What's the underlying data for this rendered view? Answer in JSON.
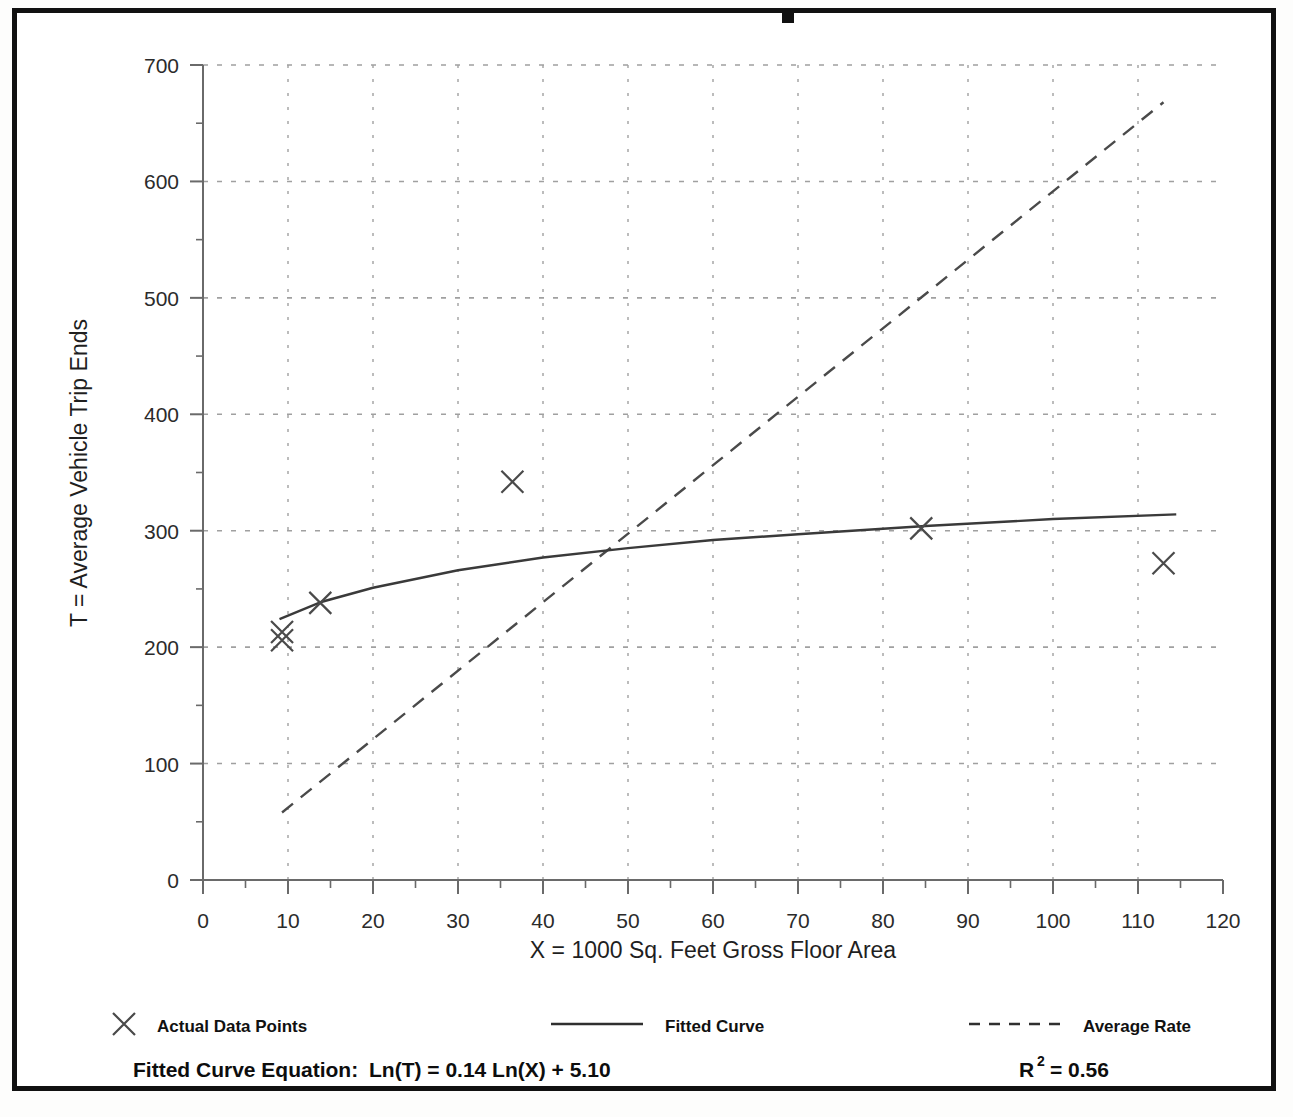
{
  "frame": {
    "top_marker": "black-tab-mark"
  },
  "chart_data": {
    "type": "scatter",
    "title": "",
    "xlabel": "X = 1000 Sq. Feet Gross Floor Area",
    "ylabel": "T = Average Vehicle Trip Ends",
    "xlim": [
      0,
      120
    ],
    "ylim": [
      0,
      700
    ],
    "xticks": [
      0,
      10,
      20,
      30,
      40,
      50,
      60,
      70,
      80,
      90,
      100,
      110,
      120
    ],
    "yticks": [
      0,
      100,
      200,
      300,
      400,
      500,
      600,
      700
    ],
    "xtick_labels": [
      "0",
      "10",
      "20",
      "30",
      "40",
      "50",
      "60",
      "70",
      "80",
      "90",
      "100",
      "110",
      "120"
    ],
    "ytick_labels": [
      "0",
      "100",
      "200",
      "300",
      "400",
      "500",
      "600",
      "700"
    ],
    "x_minor_step": 5,
    "y_minor_step": 50,
    "grid": true,
    "grid_style": "dotted",
    "legend_position": "below-plot",
    "series": [
      {
        "name": "Actual Data Points",
        "type": "scatter",
        "marker": "x",
        "points": [
          {
            "x": 9.3,
            "y": 213
          },
          {
            "x": 9.3,
            "y": 206
          },
          {
            "x": 13.8,
            "y": 238
          },
          {
            "x": 36.4,
            "y": 342
          },
          {
            "x": 84.5,
            "y": 302
          },
          {
            "x": 113.0,
            "y": 272
          }
        ]
      },
      {
        "name": "Fitted Curve",
        "type": "line",
        "style": "solid",
        "equation": "Ln(T) = 0.14 Ln(X) + 5.10",
        "a": 0.14,
        "b": 5.1,
        "x_range": [
          9.0,
          114.5
        ],
        "points": [
          {
            "x": 9.0,
            "y": 224
          },
          {
            "x": 14.0,
            "y": 239
          },
          {
            "x": 20.0,
            "y": 251
          },
          {
            "x": 30.0,
            "y": 266
          },
          {
            "x": 40.0,
            "y": 277
          },
          {
            "x": 50.0,
            "y": 285
          },
          {
            "x": 60.0,
            "y": 292
          },
          {
            "x": 70.0,
            "y": 297
          },
          {
            "x": 85.0,
            "y": 304
          },
          {
            "x": 100.0,
            "y": 310
          },
          {
            "x": 114.5,
            "y": 314
          }
        ]
      },
      {
        "name": "Average Rate",
        "type": "line",
        "style": "dashed",
        "points": [
          {
            "x": 9.3,
            "y": 58
          },
          {
            "x": 113.0,
            "y": 668
          }
        ]
      }
    ]
  },
  "legend": {
    "items": [
      {
        "label": "Actual Data Points",
        "marker": "x-marker"
      },
      {
        "label": "Fitted Curve",
        "marker": "solid-line"
      },
      {
        "label": "Average Rate",
        "marker": "dashed-line"
      }
    ]
  },
  "footer": {
    "equation_label": "Fitted Curve Equation:",
    "equation_value": "Ln(T) = 0.14 Ln(X) + 5.10",
    "r2_label": "R",
    "r2_exponent": "2",
    "r2_value": "= 0.56"
  },
  "colors": {
    "frame": "#111111",
    "axis": "#555555",
    "grid": "#9a9a9a",
    "data": "#3a3a3a",
    "text": "#1a1a1a"
  }
}
